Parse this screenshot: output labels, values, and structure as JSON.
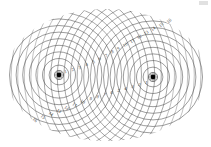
{
  "figure": {
    "background_color": "#ffffff",
    "line_color": "#4a4a4a",
    "label_color": "#3a3a3a",
    "source_marker_color": "#000000",
    "width": 211,
    "height": 147
  },
  "sources": [
    {
      "name": "left-source",
      "label": "S1",
      "cx": 59,
      "cy": 75,
      "marker_radius": 2.4,
      "halo_radius": 4.6,
      "wavefront_count": 26,
      "wavelength": 6.6
    },
    {
      "name": "right-source",
      "label": "S2",
      "cx": 153,
      "cy": 77,
      "marker_radius": 2.4,
      "halo_radius": 4.6,
      "wavefront_count": 26,
      "wavelength": 6.6
    }
  ],
  "clip": {
    "shape": "rounded-lens",
    "cx": 106,
    "cy": 75,
    "rx": 100,
    "ry": 66
  },
  "order_labels": {
    "upper_right_diagonal": [
      "5",
      "6",
      "7",
      "8",
      "9",
      "10",
      "11",
      "12",
      "13",
      "14",
      "15",
      "16"
    ],
    "lower_left_diagonal": [
      "5",
      "6",
      "7",
      "8",
      "9",
      "10",
      "11",
      "12",
      "13",
      "14",
      "15",
      "16"
    ],
    "left_source_axis": [
      "1",
      "2",
      "3",
      "4"
    ],
    "right_source_axis": [
      "1",
      "2",
      "3",
      "4"
    ],
    "inner_upper": [
      "6",
      "7",
      "8",
      "9"
    ],
    "inner_lower": [
      "6",
      "7",
      "8",
      "9"
    ]
  },
  "chart_data": {
    "type": "scatter",
    "xlabel": "",
    "ylabel": "",
    "xlim": [
      0,
      211
    ],
    "ylim": [
      0,
      147
    ],
    "grid": false,
    "series": [
      {
        "name": "left-source-wavefronts",
        "center": [
          59,
          75
        ],
        "radii": [
          3.3,
          9.9,
          16.5,
          23.1,
          29.7,
          36.3,
          42.9,
          49.5,
          56.1,
          62.7,
          69.3,
          75.9,
          82.5,
          89.1,
          95.7,
          102.3,
          108.9,
          115.5,
          122.1,
          128.7,
          135.3,
          141.9,
          148.5,
          155.1,
          161.7,
          168.3
        ]
      },
      {
        "name": "right-source-wavefronts",
        "center": [
          153,
          77
        ],
        "radii": [
          3.3,
          9.9,
          16.5,
          23.1,
          29.7,
          36.3,
          42.9,
          49.5,
          56.1,
          62.7,
          69.3,
          75.9,
          82.5,
          89.1,
          95.7,
          102.3,
          108.9,
          115.5,
          122.1,
          128.7,
          135.3,
          141.9,
          148.5,
          155.1,
          161.7,
          168.3
        ]
      }
    ],
    "annotations": [
      {
        "text": "1",
        "x": 66,
        "y": 73,
        "rotation": -12
      },
      {
        "text": "2",
        "x": 73,
        "y": 71,
        "rotation": -14
      },
      {
        "text": "3",
        "x": 80,
        "y": 69,
        "rotation": -16
      },
      {
        "text": "4",
        "x": 87,
        "y": 66,
        "rotation": -18
      },
      {
        "text": "5",
        "x": 94,
        "y": 63,
        "rotation": -20
      },
      {
        "text": "6",
        "x": 100,
        "y": 60,
        "rotation": -22
      },
      {
        "text": "7",
        "x": 107,
        "y": 57,
        "rotation": -24
      },
      {
        "text": "8",
        "x": 113,
        "y": 53,
        "rotation": -26
      },
      {
        "text": "9",
        "x": 119,
        "y": 50,
        "rotation": -28
      },
      {
        "text": "10",
        "x": 126,
        "y": 46,
        "rotation": -30
      },
      {
        "text": "11",
        "x": 133,
        "y": 42,
        "rotation": -32
      },
      {
        "text": "12",
        "x": 140,
        "y": 38,
        "rotation": -34
      },
      {
        "text": "13",
        "x": 147,
        "y": 34,
        "rotation": -36
      },
      {
        "text": "14",
        "x": 154,
        "y": 30,
        "rotation": -38
      },
      {
        "text": "15",
        "x": 162,
        "y": 26,
        "rotation": -40
      },
      {
        "text": "16",
        "x": 170,
        "y": 22,
        "rotation": -42
      },
      {
        "text": "1",
        "x": 146,
        "y": 84,
        "rotation": 12
      },
      {
        "text": "2",
        "x": 139,
        "y": 86,
        "rotation": 14
      },
      {
        "text": "3",
        "x": 132,
        "y": 88,
        "rotation": 16
      },
      {
        "text": "4",
        "x": 125,
        "y": 90,
        "rotation": 18
      },
      {
        "text": "5",
        "x": 118,
        "y": 92,
        "rotation": 20
      },
      {
        "text": "6",
        "x": 111,
        "y": 94,
        "rotation": 22
      },
      {
        "text": "7",
        "x": 104,
        "y": 96,
        "rotation": 24
      },
      {
        "text": "8",
        "x": 97,
        "y": 98,
        "rotation": 26
      },
      {
        "text": "9",
        "x": 90,
        "y": 100,
        "rotation": 28
      },
      {
        "text": "10",
        "x": 82,
        "y": 103,
        "rotation": 30
      },
      {
        "text": "11",
        "x": 74,
        "y": 106,
        "rotation": 32
      },
      {
        "text": "12",
        "x": 66,
        "y": 109,
        "rotation": 34
      },
      {
        "text": "13",
        "x": 58,
        "y": 112,
        "rotation": 36
      },
      {
        "text": "14",
        "x": 50,
        "y": 115,
        "rotation": 38
      },
      {
        "text": "15",
        "x": 42,
        "y": 118,
        "rotation": 40
      },
      {
        "text": "16",
        "x": 34,
        "y": 121,
        "rotation": 42
      }
    ]
  }
}
